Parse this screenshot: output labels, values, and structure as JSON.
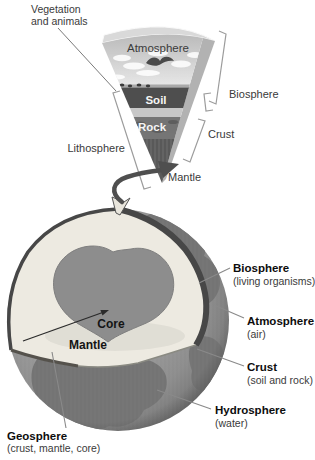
{
  "wedge": {
    "vegetation_label_line1": "Vegetation",
    "vegetation_label_line2": "and animals",
    "atmosphere_label": "Atmosphere",
    "soil_label": "Soil",
    "rock_label": "Rock",
    "mantle_label": "Mantle",
    "lithosphere_label": "Lithosphere",
    "crust_label": "Crust",
    "biosphere_label": "Biosphere"
  },
  "globe": {
    "core_label": "Core",
    "mantle_label": "Mantle",
    "callouts": [
      {
        "id": "biosphere",
        "title": "Biosphere",
        "subtitle": "(living organisms)"
      },
      {
        "id": "atmosphere",
        "title": "Atmosphere",
        "subtitle": "(air)"
      },
      {
        "id": "crust",
        "title": "Crust",
        "subtitle": "(soil and rock)"
      },
      {
        "id": "hydrosphere",
        "title": "Hydrosphere",
        "subtitle": "(water)"
      },
      {
        "id": "geosphere",
        "title": "Geosphere",
        "subtitle": "(crust, mantle, core)"
      }
    ]
  },
  "colors": {
    "background": "#ffffff",
    "label_text": "#3a3a3a",
    "bold_label_text": "#0d0d0d",
    "sky": "#c2c2c2",
    "soil_band": "#4e4e4e",
    "rock_band": "#757575",
    "mantle_band": "#646464",
    "mantle_cut_face": "#edeae1",
    "core": "#8d8d8d",
    "crust_rim": "#474747",
    "ocean": "#9e9e9e",
    "continent": "#767676"
  }
}
